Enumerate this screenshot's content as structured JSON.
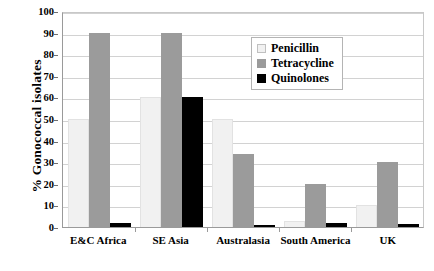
{
  "chart_data": {
    "type": "bar",
    "title": "",
    "xlabel": "",
    "ylabel": "% Gonococcal isolates",
    "ylim": [
      0,
      100
    ],
    "ytick_step": 10,
    "yticks": [
      "0",
      "10",
      "20",
      "30",
      "40",
      "50",
      "60",
      "70",
      "80",
      "90",
      "100"
    ],
    "grid": true,
    "legend_position": "upper-right-inside",
    "categories": [
      "E&C Africa",
      "SE Asia",
      "Australasia",
      "South America",
      "UK"
    ],
    "series": [
      {
        "name": "Penicillin",
        "color": "#f1f1f1",
        "values": [
          50,
          60,
          50,
          3,
          10
        ]
      },
      {
        "name": "Tetracycline",
        "color": "#9b9b9b",
        "values": [
          90,
          90,
          34,
          20,
          30
        ]
      },
      {
        "name": "Quinolones",
        "color": "#000000",
        "values": [
          2,
          60,
          1,
          2,
          1.5
        ]
      }
    ]
  }
}
